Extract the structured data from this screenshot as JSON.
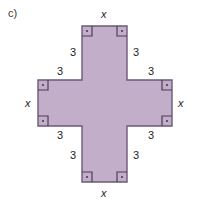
{
  "figure": {
    "part_label": "c)",
    "shape_name": "greek-cross",
    "fill_color": "#c2aec9",
    "stroke_color": "#6b5a77",
    "background_color": "#ffffff",
    "text_color": "#1e1e1e",
    "arm_labels": {
      "top": "x",
      "bottom": "x",
      "left": "x",
      "right": "x"
    },
    "side_labels": {
      "top_left": "3",
      "top_right": "3",
      "left_upper": "3",
      "right_upper": "3",
      "left_lower": "3",
      "right_lower": "3",
      "bottom_left": "3",
      "bottom_right": "3"
    },
    "right_angle_marker_count": 8,
    "geometry": {
      "outer_left": 38,
      "outer_right": 172,
      "outer_top": 26,
      "outer_bottom": 182,
      "inner_left": 82,
      "inner_right": 127,
      "inner_top": 80,
      "inner_bottom": 126
    }
  }
}
